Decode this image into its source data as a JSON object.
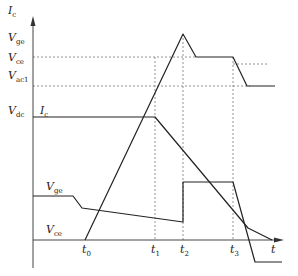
{
  "diagram": {
    "type": "switching-waveform",
    "y_axis": {
      "label_main": "I",
      "label_sub": "c"
    },
    "x_axis": {
      "label": "t"
    },
    "left_labels": [
      {
        "main": "V",
        "sub": "ge",
        "y": 41
      },
      {
        "main": "V",
        "sub": "ce",
        "y": 61
      },
      {
        "main": "V",
        "sub": "ac1",
        "y": 79
      },
      {
        "main": "V",
        "sub": "dc",
        "y": 114
      }
    ],
    "curve_labels": {
      "ic": {
        "main": "I",
        "sub": "c"
      },
      "vge": {
        "main": "V",
        "sub": "ge"
      },
      "vce": {
        "main": "V",
        "sub": "ce"
      }
    },
    "time_marks": [
      {
        "main": "t",
        "sub": "0",
        "x": 85
      },
      {
        "main": "t",
        "sub": "1",
        "x": 155
      },
      {
        "main": "t",
        "sub": "2",
        "x": 183
      },
      {
        "main": "t",
        "sub": "3",
        "x": 233
      }
    ],
    "colors": {
      "line": "#222222",
      "dash": "#777777"
    }
  }
}
